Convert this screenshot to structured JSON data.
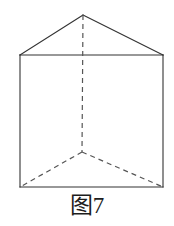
{
  "figure": {
    "caption": "图7",
    "colors": {
      "background": "#ffffff",
      "solid_edge": "#333333",
      "hidden_edge": "#555555",
      "caption_text": "#1d1d1d"
    },
    "stroke": {
      "solid_width": 1.1,
      "hidden_width": 1.2,
      "dash_pattern": "5,4"
    },
    "vertices": {
      "apex_back_top": {
        "x": 83,
        "y": 15
      },
      "front_top_left": {
        "x": 20,
        "y": 55
      },
      "front_top_right": {
        "x": 163,
        "y": 55
      },
      "front_bottom_left": {
        "x": 20,
        "y": 187
      },
      "front_bottom_right": {
        "x": 163,
        "y": 187
      },
      "back_bottom_hidden": {
        "x": 82,
        "y": 152
      }
    },
    "solid_edges": [
      {
        "name": "roof-left-edge",
        "from": "front_top_left",
        "to": "apex_back_top"
      },
      {
        "name": "roof-right-edge",
        "from": "apex_back_top",
        "to": "front_top_right"
      },
      {
        "name": "front-top-edge",
        "from": "front_top_left",
        "to": "front_top_right"
      },
      {
        "name": "front-left-edge",
        "from": "front_top_left",
        "to": "front_bottom_left"
      },
      {
        "name": "front-right-edge",
        "from": "front_top_right",
        "to": "front_bottom_right"
      },
      {
        "name": "front-bottom-edge",
        "from": "front_bottom_left",
        "to": "front_bottom_right"
      }
    ],
    "hidden_edges": [
      {
        "name": "back-vertical-edge",
        "from": "apex_back_top",
        "to": "back_bottom_hidden"
      },
      {
        "name": "base-back-left-edge",
        "from": "back_bottom_hidden",
        "to": "front_bottom_left"
      },
      {
        "name": "base-back-right-edge",
        "from": "back_bottom_hidden",
        "to": "front_bottom_right"
      }
    ]
  }
}
